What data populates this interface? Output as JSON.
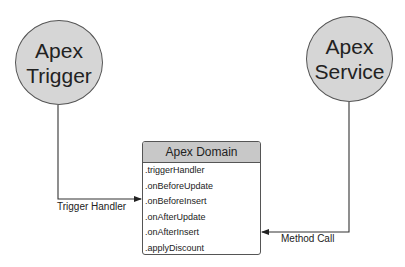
{
  "diagram": {
    "nodes": {
      "trigger": {
        "line1": "Apex",
        "line2": "Trigger"
      },
      "service": {
        "line1": "Apex",
        "line2": "Service"
      },
      "domain": {
        "title": "Apex Domain",
        "methods": [
          ".triggerHandler",
          ".onBeforeUpdate",
          ".onBeforeInsert",
          ".onAfterUpdate",
          ".onAfterInsert",
          ".applyDiscount"
        ]
      }
    },
    "edges": [
      {
        "from": "Apex Trigger",
        "to": "Apex Domain (.onBeforeInsert)",
        "label": "Trigger Handler"
      },
      {
        "from": "Apex Service",
        "to": "Apex Domain (.onAfterInsert)",
        "label": "Method Call"
      }
    ],
    "colors": {
      "circle_fill": "#d6d6d6",
      "header_fill": "#c8c8c8",
      "stroke": "#555555"
    }
  }
}
